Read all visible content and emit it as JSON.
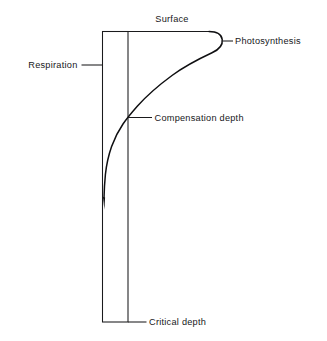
{
  "figure": {
    "title_text": "",
    "background_color": "#ffffff",
    "ink_color": "#1a1a1c",
    "labels": {
      "surface": "Surface",
      "photosynthesis": "Photosynthesis",
      "respiration": "Respiration",
      "compensation_depth": "Compensation depth",
      "critical_depth": "Critical depth"
    },
    "elements": {
      "water_column_box": "water-column",
      "surface_line": "surface-line",
      "photosynthesis_curve": "photosynthesis-curve"
    }
  }
}
